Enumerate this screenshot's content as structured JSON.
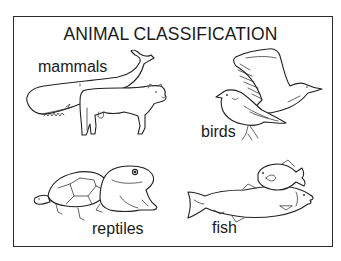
{
  "diagram": {
    "title": "ANIMAL CLASSIFICATION",
    "groups": [
      {
        "label": "mammals",
        "animals": [
          "whale-icon",
          "cow-icon"
        ]
      },
      {
        "label": "birds",
        "animals": [
          "gull-icon",
          "songbird-icon"
        ]
      },
      {
        "label": "reptiles",
        "animals": [
          "turtle-icon",
          "frog-icon"
        ]
      },
      {
        "label": "fish",
        "animals": [
          "salmon-icon",
          "sunfish-icon"
        ]
      }
    ],
    "colors": {
      "line": "#222222",
      "background": "#ffffff",
      "frame": "#2b2b2b"
    }
  }
}
